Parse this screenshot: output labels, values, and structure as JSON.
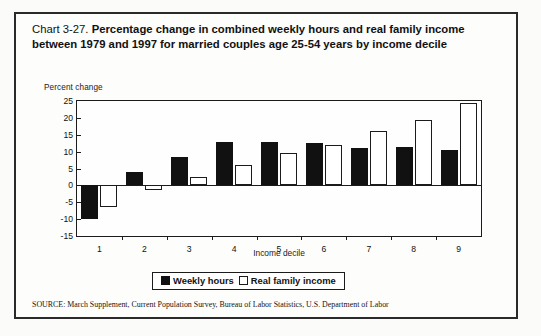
{
  "title": {
    "chart_number": "Chart 3-27.",
    "text": "Percentage change in combined weekly hours and real family income between 1979 and 1997 for married couples age 25-54 years by income decile"
  },
  "legend": {
    "series1_label": "Weekly hours",
    "series2_label": "Real family income"
  },
  "source": "SOURCE: March Supplement, Current Population Survey, Bureau of Labor Statistics, U.S. Department of Labor",
  "chart_data": {
    "type": "bar",
    "title": "Percentage change in combined weekly hours and real family income between 1979 and 1997 for married couples age 25-54 years by income decile",
    "xlabel": "Income decile",
    "ylabel": "Percent change",
    "categories": [
      "1",
      "2",
      "3",
      "4",
      "5",
      "6",
      "7",
      "8",
      "9"
    ],
    "series": [
      {
        "name": "Weekly hours",
        "color": "#111111",
        "values": [
          -10,
          4,
          8.5,
          13,
          13,
          12.5,
          11,
          11.5,
          10.5
        ]
      },
      {
        "name": "Real family income",
        "color": "#ffffff",
        "values": [
          -6.5,
          -1.5,
          2.5,
          6,
          9.5,
          12,
          16,
          19.5,
          24.5
        ]
      }
    ],
    "ylim": [
      -15,
      25
    ],
    "yticks": [
      25,
      20,
      15,
      10,
      5,
      0,
      -5,
      -10,
      -15
    ],
    "ytick_labels": [
      "25",
      "20",
      "15",
      "10",
      "5",
      "0",
      "-5",
      "-10",
      "-15"
    ],
    "grid": false,
    "legend_position": "bottom"
  }
}
